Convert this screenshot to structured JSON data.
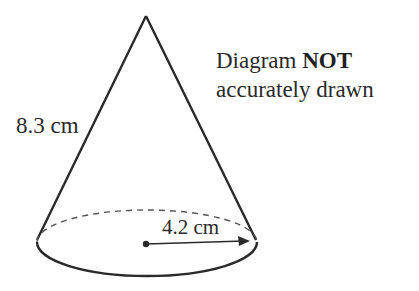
{
  "diagram": {
    "shape": "cone",
    "labels": {
      "slant_height": "8.3 cm",
      "radius": "4.2 cm"
    },
    "note": {
      "line1_prefix": "Diagram ",
      "line1_bold": "NOT",
      "line2": "accurately drawn"
    },
    "colors": {
      "stroke": "#2a2a2a",
      "background": "#ffffff"
    }
  }
}
